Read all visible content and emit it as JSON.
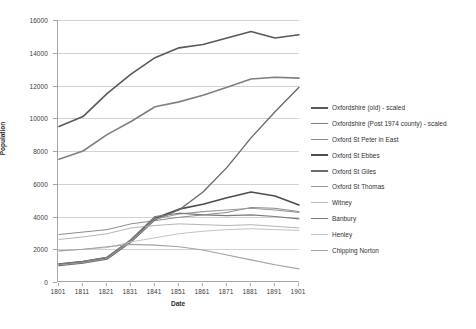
{
  "chart_data": {
    "type": "line",
    "title": "",
    "xlabel": "Date",
    "ylabel": "Population",
    "x": [
      1801,
      1811,
      1821,
      1831,
      1841,
      1851,
      1861,
      1871,
      1881,
      1891,
      1901
    ],
    "xlim": [
      1801,
      1901
    ],
    "ylim": [
      0,
      16000
    ],
    "yticks": [
      0,
      2000,
      4000,
      6000,
      8000,
      10000,
      12000,
      14000,
      16000
    ],
    "grid": true,
    "legend_position": "right",
    "series": [
      {
        "name": "Oxfordshire (old) - scaled",
        "color": "#595959",
        "width": 1.6,
        "values": [
          9500,
          10100,
          11500,
          12700,
          13700,
          14300,
          14500,
          14900,
          15300,
          14900,
          15100
        ]
      },
      {
        "name": "Oxfordshire (Post 1974 county) - scaled",
        "color": "#7f7f7f",
        "width": 1.6,
        "values": [
          7500,
          8000,
          9000,
          9800,
          10700,
          11000,
          11400,
          11900,
          12400,
          12500,
          12450
        ]
      },
      {
        "name": "Oxford St Peter in East",
        "color": "#8c8c8c",
        "width": 1.0,
        "values": [
          2900,
          3050,
          3200,
          3550,
          3750,
          3950,
          4100,
          4250,
          4550,
          4500,
          4300
        ]
      },
      {
        "name": "Oxford St Ebbes",
        "color": "#4d4d4d",
        "width": 1.6,
        "values": [
          1100,
          1250,
          1500,
          2550,
          3900,
          4450,
          4750,
          5150,
          5500,
          5250,
          4700
        ]
      },
      {
        "name": "Oxford St Giles",
        "color": "#6b6b6b",
        "width": 1.4,
        "values": [
          1000,
          1150,
          1400,
          2450,
          3800,
          4400,
          5500,
          7000,
          8800,
          10400,
          11900
        ]
      },
      {
        "name": "Oxford St Thomas",
        "color": "#9a9a9a",
        "width": 1.1,
        "values": [
          1050,
          1200,
          1450,
          2500,
          3850,
          4150,
          4300,
          4400,
          4500,
          4400,
          4250
        ]
      },
      {
        "name": "Witney",
        "color": "#b5b5b5",
        "width": 1.0,
        "values": [
          2600,
          2750,
          2950,
          3300,
          3450,
          3550,
          3500,
          3450,
          3500,
          3400,
          3300
        ]
      },
      {
        "name": "Banbury",
        "color": "#7a7a7a",
        "width": 1.2,
        "values": [
          1100,
          1250,
          1500,
          2600,
          4000,
          4200,
          4100,
          4050,
          4100,
          4000,
          3850
        ]
      },
      {
        "name": "Henley",
        "color": "#c4c4c4",
        "width": 1.0,
        "values": [
          1900,
          2000,
          2100,
          2450,
          2700,
          2950,
          3100,
          3200,
          3250,
          3200,
          3150
        ]
      },
      {
        "name": "Chipping Norton",
        "color": "#a3a3a3",
        "width": 1.1,
        "values": [
          1900,
          2000,
          2150,
          2300,
          2250,
          2150,
          1950,
          1650,
          1350,
          1050,
          800
        ]
      }
    ]
  },
  "axes": {
    "y_title": "Population",
    "x_title": "Date",
    "y_tick_labels": [
      "0",
      "2000",
      "4000",
      "6000",
      "8000",
      "10000",
      "12000",
      "14000",
      "16000"
    ],
    "x_tick_labels": [
      "1801",
      "1811",
      "1821",
      "1831",
      "1841",
      "1851",
      "1861",
      "1871",
      "1881",
      "1891",
      "1901"
    ]
  },
  "legend": {
    "items": [
      {
        "label": "Oxfordshire (old) - scaled"
      },
      {
        "label": "Oxfordshire (Post 1974 county) - scaled"
      },
      {
        "label": "Oxford St Peter in East"
      },
      {
        "label": "Oxford St Ebbes"
      },
      {
        "label": "Oxford St Giles"
      },
      {
        "label": "Oxford St Thomas"
      },
      {
        "label": "Witney"
      },
      {
        "label": "Banbury"
      },
      {
        "label": "Henley"
      },
      {
        "label": "Chipping Norton"
      }
    ]
  },
  "colors": {
    "gridline": "#d2d2d2",
    "axis": "#a6a6a6",
    "text": "#3b3b3b",
    "background": "#ffffff"
  }
}
